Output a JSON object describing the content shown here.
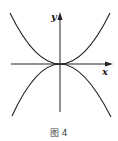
{
  "figure": {
    "caption": "图 4",
    "axes": {
      "x_label": "x",
      "y_label": "y"
    },
    "curves": [
      {
        "name": "upward-parabola",
        "description": "curve opening upward, tangent to x-axis at origin"
      },
      {
        "name": "downward-parabola",
        "description": "curve opening downward, tangent to x-axis at origin"
      }
    ],
    "stroke_color": "#222222",
    "background": "#ffffff"
  }
}
